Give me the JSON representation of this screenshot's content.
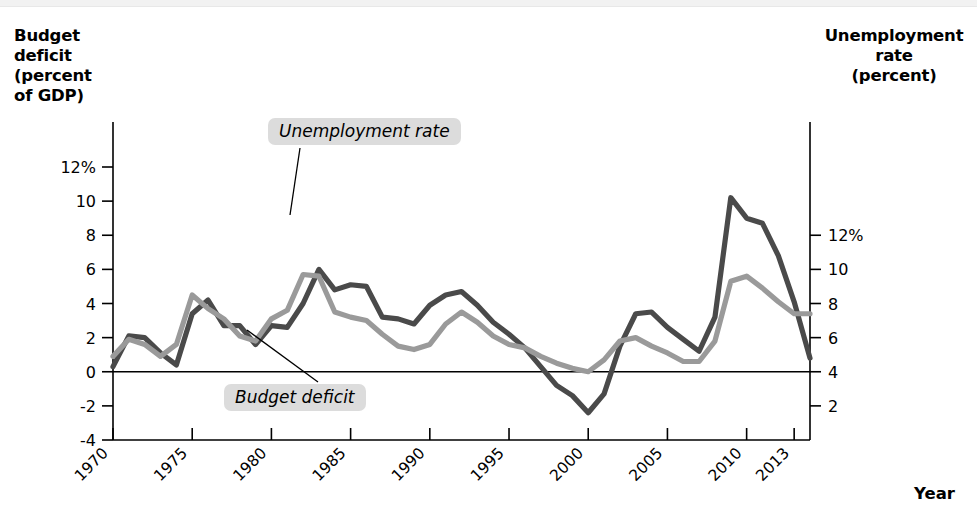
{
  "figure": {
    "background_color": "#ffffff",
    "left_axis_title": "Budget deficit (percent of GDP)",
    "left_axis_title_lines": [
      "Budget",
      "deficit",
      "(percent",
      "of GDP)"
    ],
    "right_axis_title": "Unemployment rate (percent)",
    "right_axis_title_lines": [
      "Unemployment",
      "rate",
      "(percent)"
    ],
    "x_axis_title": "Year"
  },
  "callouts": [
    {
      "id": "unemployment",
      "text": "Unemployment rate"
    },
    {
      "id": "deficit",
      "text": "Budget deficit"
    }
  ],
  "axes": {
    "left": {
      "label": "Budget deficit (percent of GDP)",
      "ticks": [
        "12%",
        "10",
        "8",
        "6",
        "4",
        "2",
        "0",
        "-2",
        "-4"
      ],
      "values": [
        12,
        10,
        8,
        6,
        4,
        2,
        0,
        -2,
        -4
      ],
      "min": -4,
      "max": 12
    },
    "right": {
      "label": "Unemployment rate (percent)",
      "ticks": [
        "12%",
        "10",
        "8",
        "6",
        "4",
        "2"
      ],
      "values": [
        12,
        10,
        8,
        6,
        4,
        2
      ],
      "min": 0,
      "max": 12
    },
    "x": {
      "label": "Year",
      "ticks": [
        "1970",
        "1975",
        "1980",
        "1985",
        "1990",
        "1995",
        "2000",
        "2005",
        "2010",
        "2013"
      ],
      "values": [
        1970,
        1975,
        1980,
        1985,
        1990,
        1995,
        2000,
        2005,
        2010,
        2013
      ],
      "min": 1970,
      "max": 2014
    }
  },
  "colors": {
    "budget_deficit_line": "#4a4a4a",
    "unemployment_line": "#9a9a9a",
    "axis": "#000000",
    "callout_background": "#dcdcdc"
  },
  "chart_data": {
    "type": "line",
    "xlabel": "Year",
    "ylabel": "Budget deficit (percent of GDP)",
    "y2label": "Unemployment rate (percent)",
    "xlim": [
      1970,
      2014
    ],
    "ylim": [
      -4,
      12
    ],
    "y2lim": [
      0,
      12
    ],
    "grid": false,
    "legend": "annotated callouts on plot",
    "x": [
      1970,
      1971,
      1972,
      1973,
      1974,
      1975,
      1976,
      1977,
      1978,
      1979,
      1980,
      1981,
      1982,
      1983,
      1984,
      1985,
      1986,
      1987,
      1988,
      1989,
      1990,
      1991,
      1992,
      1993,
      1994,
      1995,
      1996,
      1997,
      1998,
      1999,
      2000,
      2001,
      2002,
      2003,
      2004,
      2005,
      2006,
      2007,
      2008,
      2009,
      2010,
      2011,
      2012,
      2013,
      2014
    ],
    "series": [
      {
        "name": "Budget deficit",
        "axis": "left",
        "color": "#4a4a4a",
        "units": "percent of GDP",
        "values": [
          0.3,
          2.1,
          2.0,
          1.1,
          0.4,
          3.4,
          4.2,
          2.7,
          2.7,
          1.6,
          2.7,
          2.6,
          4.0,
          6.0,
          4.8,
          5.1,
          5.0,
          3.2,
          3.1,
          2.8,
          3.9,
          4.5,
          4.7,
          3.9,
          2.9,
          2.2,
          1.4,
          0.3,
          -0.8,
          -1.4,
          -2.4,
          -1.3,
          1.5,
          3.4,
          3.5,
          2.6,
          1.9,
          1.2,
          3.2,
          10.2,
          9.0,
          8.7,
          6.8,
          4.1,
          0.8
        ]
      },
      {
        "name": "Unemployment rate",
        "axis": "right",
        "color": "#9a9a9a",
        "units": "percent",
        "values": [
          4.9,
          5.9,
          5.6,
          4.9,
          5.6,
          8.5,
          7.7,
          7.1,
          6.1,
          5.8,
          7.1,
          7.6,
          9.7,
          9.6,
          7.5,
          7.2,
          7.0,
          6.2,
          5.5,
          5.3,
          5.6,
          6.8,
          7.5,
          6.9,
          6.1,
          5.6,
          5.4,
          4.9,
          4.5,
          4.2,
          4.0,
          4.7,
          5.8,
          6.0,
          5.5,
          5.1,
          4.6,
          4.6,
          5.8,
          9.3,
          9.6,
          8.9,
          8.1,
          7.4,
          7.4
        ]
      }
    ]
  }
}
